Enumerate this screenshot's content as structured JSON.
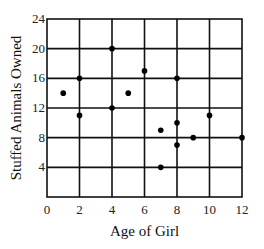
{
  "chart_data": {
    "type": "scatter",
    "title": "",
    "xlabel": "Age of Girl",
    "ylabel": "Stuffed Animals Owned",
    "xlim": [
      0,
      12
    ],
    "ylim": [
      0,
      24
    ],
    "x_ticks": [
      0,
      2,
      4,
      6,
      8,
      10,
      12
    ],
    "y_ticks": [
      4,
      8,
      12,
      16,
      20,
      24
    ],
    "x_tick_labels": [
      "0",
      "2",
      "4",
      "6",
      "8",
      "10",
      "12"
    ],
    "y_tick_labels": [
      "4",
      "8",
      "12",
      "16",
      "20",
      "24"
    ],
    "grid": true,
    "legend": null,
    "series": [
      {
        "name": "girls",
        "points": [
          {
            "x": 1,
            "y": 14
          },
          {
            "x": 2,
            "y": 16
          },
          {
            "x": 2,
            "y": 11
          },
          {
            "x": 4,
            "y": 20
          },
          {
            "x": 4,
            "y": 12
          },
          {
            "x": 5,
            "y": 14
          },
          {
            "x": 6,
            "y": 17
          },
          {
            "x": 7,
            "y": 9
          },
          {
            "x": 7,
            "y": 4
          },
          {
            "x": 8,
            "y": 16
          },
          {
            "x": 8,
            "y": 10
          },
          {
            "x": 8,
            "y": 7
          },
          {
            "x": 9,
            "y": 8
          },
          {
            "x": 10,
            "y": 11
          },
          {
            "x": 12,
            "y": 8
          }
        ]
      }
    ]
  }
}
